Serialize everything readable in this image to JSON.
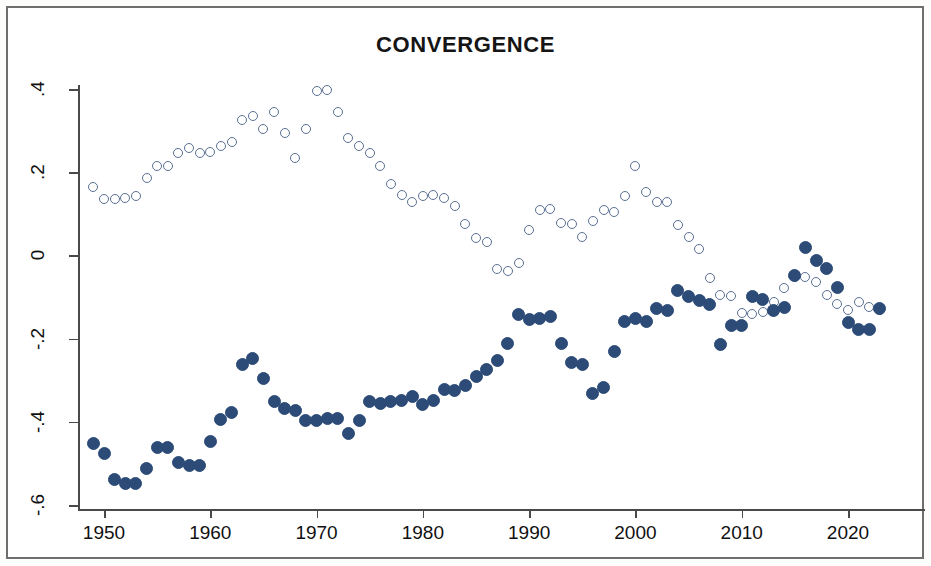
{
  "chart": {
    "title": "CONVERGENCE",
    "frame_color": "#6f6f6f",
    "background": "#ffffff"
  },
  "axes": {
    "y_ticks": [
      ".4",
      ".2",
      "0",
      "-.2",
      "-.4",
      "-.6"
    ],
    "y_tick_values": [
      0.4,
      0.2,
      0,
      -0.2,
      -0.4,
      -0.6
    ],
    "x_ticks": [
      "1950",
      "1960",
      "1970",
      "1980",
      "1990",
      "2000",
      "2010",
      "2020"
    ],
    "x_tick_values": [
      1950,
      1960,
      1970,
      1980,
      1990,
      2000,
      2010,
      2020
    ]
  },
  "chart_data": {
    "type": "scatter",
    "title": "CONVERGENCE",
    "xlabel": "",
    "ylabel": "",
    "xlim": [
      1947,
      2025
    ],
    "ylim": [
      -0.6,
      0.42
    ],
    "grid": false,
    "legend": "none",
    "marker_colors": {
      "filled": "#2c4b77",
      "hollow": "#5a6f92"
    },
    "series": [
      {
        "name": "hollow-series",
        "marker": "open-circle",
        "color": "#5a6f92",
        "points": [
          {
            "x": 1949,
            "y": 0.165
          },
          {
            "x": 1950,
            "y": 0.135
          },
          {
            "x": 1951,
            "y": 0.135
          },
          {
            "x": 1952,
            "y": 0.138
          },
          {
            "x": 1953,
            "y": 0.142
          },
          {
            "x": 1954,
            "y": 0.185
          },
          {
            "x": 1955,
            "y": 0.215
          },
          {
            "x": 1956,
            "y": 0.215
          },
          {
            "x": 1957,
            "y": 0.245
          },
          {
            "x": 1958,
            "y": 0.258
          },
          {
            "x": 1959,
            "y": 0.245
          },
          {
            "x": 1960,
            "y": 0.248
          },
          {
            "x": 1961,
            "y": 0.262
          },
          {
            "x": 1962,
            "y": 0.272
          },
          {
            "x": 1963,
            "y": 0.325
          },
          {
            "x": 1964,
            "y": 0.335
          },
          {
            "x": 1965,
            "y": 0.305
          },
          {
            "x": 1966,
            "y": 0.345
          },
          {
            "x": 1967,
            "y": 0.295
          },
          {
            "x": 1968,
            "y": 0.235
          },
          {
            "x": 1969,
            "y": 0.305
          },
          {
            "x": 1970,
            "y": 0.395
          },
          {
            "x": 1971,
            "y": 0.398
          },
          {
            "x": 1972,
            "y": 0.345
          },
          {
            "x": 1973,
            "y": 0.282
          },
          {
            "x": 1974,
            "y": 0.262
          },
          {
            "x": 1975,
            "y": 0.245
          },
          {
            "x": 1976,
            "y": 0.215
          },
          {
            "x": 1977,
            "y": 0.172
          },
          {
            "x": 1978,
            "y": 0.145
          },
          {
            "x": 1979,
            "y": 0.128
          },
          {
            "x": 1980,
            "y": 0.142
          },
          {
            "x": 1981,
            "y": 0.145
          },
          {
            "x": 1982,
            "y": 0.138
          },
          {
            "x": 1983,
            "y": 0.118
          },
          {
            "x": 1984,
            "y": 0.075
          },
          {
            "x": 1985,
            "y": 0.042
          },
          {
            "x": 1986,
            "y": 0.032
          },
          {
            "x": 1987,
            "y": -0.032
          },
          {
            "x": 1988,
            "y": -0.038
          },
          {
            "x": 1989,
            "y": -0.018
          },
          {
            "x": 1990,
            "y": 0.062
          },
          {
            "x": 1991,
            "y": 0.108
          },
          {
            "x": 1992,
            "y": 0.112
          },
          {
            "x": 1993,
            "y": 0.078
          },
          {
            "x": 1994,
            "y": 0.075
          },
          {
            "x": 1995,
            "y": 0.045
          },
          {
            "x": 1996,
            "y": 0.082
          },
          {
            "x": 1997,
            "y": 0.108
          },
          {
            "x": 1998,
            "y": 0.105
          },
          {
            "x": 1999,
            "y": 0.142
          },
          {
            "x": 2000,
            "y": 0.215
          },
          {
            "x": 2001,
            "y": 0.152
          },
          {
            "x": 2002,
            "y": 0.128
          },
          {
            "x": 2003,
            "y": 0.128
          },
          {
            "x": 2004,
            "y": 0.072
          },
          {
            "x": 2005,
            "y": 0.045
          },
          {
            "x": 2006,
            "y": 0.015
          },
          {
            "x": 2007,
            "y": -0.055
          },
          {
            "x": 2008,
            "y": -0.095
          },
          {
            "x": 2009,
            "y": -0.098
          },
          {
            "x": 2010,
            "y": -0.138
          },
          {
            "x": 2011,
            "y": -0.142
          },
          {
            "x": 2012,
            "y": -0.135
          },
          {
            "x": 2013,
            "y": -0.112
          },
          {
            "x": 2014,
            "y": -0.078
          },
          {
            "x": 2015,
            "y": -0.052
          },
          {
            "x": 2016,
            "y": -0.052
          },
          {
            "x": 2017,
            "y": -0.065
          },
          {
            "x": 2018,
            "y": -0.095
          },
          {
            "x": 2019,
            "y": -0.118
          },
          {
            "x": 2020,
            "y": -0.132
          },
          {
            "x": 2021,
            "y": -0.112
          },
          {
            "x": 2022,
            "y": -0.125
          },
          {
            "x": 2023,
            "y": -0.132
          }
        ]
      },
      {
        "name": "filled-series",
        "marker": "filled-circle",
        "color": "#2c4b77",
        "points": [
          {
            "x": 1949,
            "y": -0.452
          },
          {
            "x": 1950,
            "y": -0.475
          },
          {
            "x": 1951,
            "y": -0.538
          },
          {
            "x": 1952,
            "y": -0.548
          },
          {
            "x": 1953,
            "y": -0.548
          },
          {
            "x": 1954,
            "y": -0.512
          },
          {
            "x": 1955,
            "y": -0.462
          },
          {
            "x": 1956,
            "y": -0.462
          },
          {
            "x": 1957,
            "y": -0.498
          },
          {
            "x": 1958,
            "y": -0.505
          },
          {
            "x": 1959,
            "y": -0.505
          },
          {
            "x": 1960,
            "y": -0.448
          },
          {
            "x": 1961,
            "y": -0.395
          },
          {
            "x": 1962,
            "y": -0.378
          },
          {
            "x": 1963,
            "y": -0.262
          },
          {
            "x": 1964,
            "y": -0.248
          },
          {
            "x": 1965,
            "y": -0.295
          },
          {
            "x": 1966,
            "y": -0.352
          },
          {
            "x": 1967,
            "y": -0.368
          },
          {
            "x": 1968,
            "y": -0.372
          },
          {
            "x": 1969,
            "y": -0.398
          },
          {
            "x": 1970,
            "y": -0.398
          },
          {
            "x": 1971,
            "y": -0.392
          },
          {
            "x": 1972,
            "y": -0.392
          },
          {
            "x": 1973,
            "y": -0.428
          },
          {
            "x": 1974,
            "y": -0.398
          },
          {
            "x": 1975,
            "y": -0.352
          },
          {
            "x": 1976,
            "y": -0.355
          },
          {
            "x": 1977,
            "y": -0.352
          },
          {
            "x": 1978,
            "y": -0.348
          },
          {
            "x": 1979,
            "y": -0.338
          },
          {
            "x": 1980,
            "y": -0.358
          },
          {
            "x": 1981,
            "y": -0.348
          },
          {
            "x": 1982,
            "y": -0.322
          },
          {
            "x": 1983,
            "y": -0.325
          },
          {
            "x": 1984,
            "y": -0.312
          },
          {
            "x": 1985,
            "y": -0.292
          },
          {
            "x": 1986,
            "y": -0.275
          },
          {
            "x": 1987,
            "y": -0.252
          },
          {
            "x": 1988,
            "y": -0.212
          },
          {
            "x": 1989,
            "y": -0.142
          },
          {
            "x": 1990,
            "y": -0.155
          },
          {
            "x": 1991,
            "y": -0.152
          },
          {
            "x": 1992,
            "y": -0.148
          },
          {
            "x": 1993,
            "y": -0.212
          },
          {
            "x": 1994,
            "y": -0.258
          },
          {
            "x": 1995,
            "y": -0.262
          },
          {
            "x": 1996,
            "y": -0.332
          },
          {
            "x": 1997,
            "y": -0.318
          },
          {
            "x": 1998,
            "y": -0.232
          },
          {
            "x": 1999,
            "y": -0.158
          },
          {
            "x": 2000,
            "y": -0.152
          },
          {
            "x": 2001,
            "y": -0.158
          },
          {
            "x": 2002,
            "y": -0.128
          },
          {
            "x": 2003,
            "y": -0.132
          },
          {
            "x": 2004,
            "y": -0.085
          },
          {
            "x": 2005,
            "y": -0.098
          },
          {
            "x": 2006,
            "y": -0.108
          },
          {
            "x": 2007,
            "y": -0.118
          },
          {
            "x": 2008,
            "y": -0.215
          },
          {
            "x": 2009,
            "y": -0.168
          },
          {
            "x": 2010,
            "y": -0.168
          },
          {
            "x": 2011,
            "y": -0.098
          },
          {
            "x": 2012,
            "y": -0.105
          },
          {
            "x": 2013,
            "y": -0.132
          },
          {
            "x": 2014,
            "y": -0.125
          },
          {
            "x": 2015,
            "y": -0.048
          },
          {
            "x": 2016,
            "y": 0.018
          },
          {
            "x": 2017,
            "y": -0.012
          },
          {
            "x": 2018,
            "y": -0.032
          },
          {
            "x": 2019,
            "y": -0.078
          },
          {
            "x": 2020,
            "y": -0.162
          },
          {
            "x": 2021,
            "y": -0.178
          },
          {
            "x": 2022,
            "y": -0.178
          },
          {
            "x": 2023,
            "y": -0.128
          }
        ]
      }
    ]
  }
}
